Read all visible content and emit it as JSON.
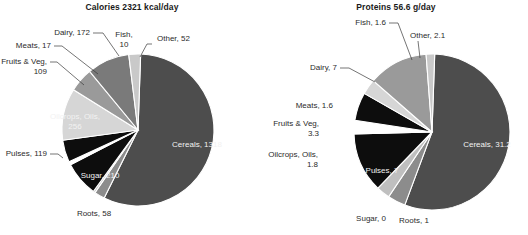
{
  "figure": {
    "background": "#ffffff",
    "label_color": "#2b2b2b",
    "inside_label_color": "#f2f2f2"
  },
  "chart_data": [
    {
      "type": "pie",
      "id": "calories",
      "title": "Calories 2321 kcal/day",
      "unit": "kcal/day",
      "total": 2321,
      "categories": [
        "Cereals",
        "Other",
        "Fish",
        "Dairy",
        "Meats",
        "Fruits & Veg",
        "Oilcrops, Oils",
        "Pulses",
        "Sugar",
        "Roots"
      ],
      "values": [
        1318,
        52,
        10,
        172,
        17,
        109,
        256,
        119,
        210,
        58
      ],
      "colors": [
        "#4d4d4d",
        "#8c8c8c",
        "#bfbfbf",
        "#0d0d0d",
        "#ffffff",
        "#0d0d0d",
        "#d6d6d6",
        "#9a9a9a",
        "#7a7a7a",
        "#c9c9c9"
      ],
      "labels": [
        {
          "text": "Cereals, 1318",
          "inside": true
        },
        {
          "text": "Other, 52",
          "inside": false
        },
        {
          "text": "Fish,",
          "text2": "10",
          "inside": false
        },
        {
          "text": "Dairy, 172",
          "inside": false
        },
        {
          "text": "Meats, 17",
          "inside": false
        },
        {
          "text": "Fruits & Veg,",
          "text2": "109",
          "inside": false
        },
        {
          "text": "Oilcrops, Oils,",
          "text2": "256",
          "inside": true
        },
        {
          "text": "Pulses, 119",
          "inside": false
        },
        {
          "text": "Sugar, 210",
          "inside": true
        },
        {
          "text": "Roots, 58",
          "inside": false
        }
      ],
      "legend": "none",
      "grid": false
    },
    {
      "type": "pie",
      "id": "proteins",
      "title": "Proteins 56.6 g/day",
      "unit": "g/day",
      "total": 56.6,
      "categories": [
        "Cereals",
        "Other",
        "Fish",
        "Dairy",
        "Meats",
        "Fruits & Veg",
        "Oilcrops, Oils",
        "Pulses",
        "Sugar",
        "Roots"
      ],
      "values": [
        31.2,
        2.1,
        1.6,
        7,
        1.6,
        3.3,
        1.8,
        7,
        0,
        1
      ],
      "colors": [
        "#4d4d4d",
        "#8c8c8c",
        "#bfbfbf",
        "#0d0d0d",
        "#ffffff",
        "#0d0d0d",
        "#d6d6d6",
        "#9a9a9a",
        "#7a7a7a",
        "#c9c9c9"
      ],
      "labels": [
        {
          "text": "Cereals, 31.2",
          "inside": true
        },
        {
          "text": "Other, 2.1",
          "inside": false
        },
        {
          "text": "Fish, 1.6",
          "inside": false
        },
        {
          "text": "Dairy, 7",
          "inside": false
        },
        {
          "text": "Meats, 1.6",
          "inside": false
        },
        {
          "text": "Fruits & Veg,",
          "text2": "3.3",
          "inside": false
        },
        {
          "text": "Oilcrops, Oils,",
          "text2": "1.8",
          "inside": false
        },
        {
          "text": "Pulses, 7",
          "inside": true
        },
        {
          "text": "Sugar, 0",
          "inside": false
        },
        {
          "text": "Roots, 1",
          "inside": false
        }
      ],
      "legend": "none",
      "grid": false
    }
  ],
  "geometry": [
    {
      "cx": 138,
      "cy": 130,
      "r": 76,
      "start_angle": -88,
      "label_pos": [
        {
          "x": 197,
          "y": 147,
          "anchor": "middle"
        },
        {
          "x": 157,
          "y": 41,
          "anchor": "start",
          "leader": [
            [
              152,
              44
            ],
            [
              147,
              44
            ],
            [
              140,
              57
            ]
          ]
        },
        {
          "x": 124,
          "y": 37,
          "anchor": "middle",
          "y2": 47
        },
        {
          "x": 90,
          "y": 35,
          "anchor": "end",
          "leader": [
            [
              93,
              33
            ],
            [
              103,
              33
            ],
            [
              119,
              56
            ]
          ]
        },
        {
          "x": 51,
          "y": 48,
          "anchor": "end",
          "leader": [
            [
              54,
              46
            ],
            [
              62,
              46
            ],
            [
              98,
              74
            ]
          ]
        },
        {
          "x": 47,
          "y": 64,
          "anchor": "end",
          "y2": 74,
          "leader": [
            [
              50,
              62
            ],
            [
              57,
              62
            ],
            [
              84,
              85
            ]
          ]
        },
        {
          "x": 75,
          "y": 119,
          "anchor": "middle",
          "y2": 129
        },
        {
          "x": 47,
          "y": 156,
          "anchor": "end",
          "leader": [
            [
              50,
              154
            ],
            [
              58,
              154
            ],
            [
              63,
              158
            ]
          ]
        },
        {
          "x": 100,
          "y": 178,
          "anchor": "middle"
        },
        {
          "x": 94,
          "y": 216,
          "anchor": "middle"
        }
      ]
    },
    {
      "cx": 432,
      "cy": 132,
      "r": 78,
      "start_angle": -88,
      "label_pos": [
        {
          "x": 487,
          "y": 147,
          "anchor": "middle"
        },
        {
          "x": 410,
          "y": 38,
          "anchor": "start",
          "leader": [
            [
              418,
              41
            ],
            [
              420,
              58
            ]
          ]
        },
        {
          "x": 386,
          "y": 25,
          "anchor": "end",
          "leader": [
            [
              389,
              23
            ],
            [
              398,
              23
            ],
            [
              412,
              60
            ]
          ]
        },
        {
          "x": 337,
          "y": 70,
          "anchor": "end",
          "leader": [
            [
              340,
              68
            ],
            [
              349,
              68
            ],
            [
              375,
              82
            ]
          ]
        },
        {
          "x": 333,
          "y": 108,
          "anchor": "end"
        },
        {
          "x": 319,
          "y": 126,
          "anchor": "end",
          "y2": 136
        },
        {
          "x": 318,
          "y": 157,
          "anchor": "end",
          "y2": 167
        },
        {
          "x": 382,
          "y": 173,
          "anchor": "middle"
        },
        {
          "x": 371,
          "y": 221,
          "anchor": "middle"
        },
        {
          "x": 414,
          "y": 223,
          "anchor": "middle"
        }
      ]
    }
  ]
}
